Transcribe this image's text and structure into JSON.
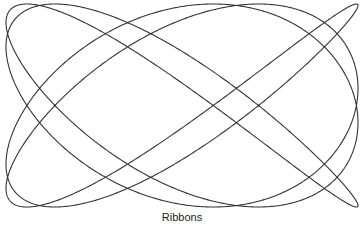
{
  "caption": "Ribbons",
  "figure": {
    "type": "lissajous",
    "freq_x": 4,
    "freq_y": 5,
    "phase": 0.45,
    "bounds": {
      "x_min": 6,
      "x_max": 358,
      "y_min": 4,
      "y_max": 207
    },
    "stroke_color": "#333333",
    "stroke_width": 1.1
  }
}
